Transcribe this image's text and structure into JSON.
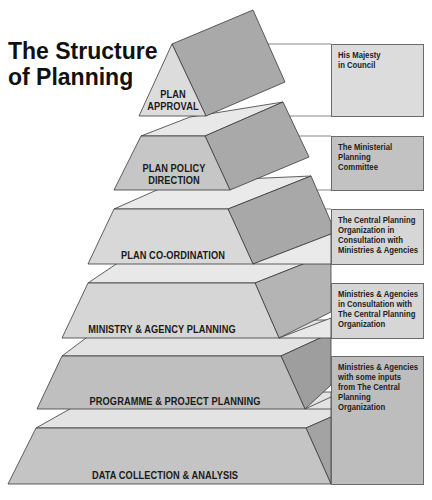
{
  "title": {
    "line1": "The Structure",
    "line2": "of Planning"
  },
  "colors": {
    "top_face": "#e8e8e8",
    "front_light": "#d8d8d8",
    "front_medium": "#c2c2c2",
    "side_dark": "#a9a9a9",
    "side_darker": "#9c9c9c",
    "box_light": "#dcdcdc",
    "box_medium": "#c0c0c0",
    "outline": "#3a3a3a"
  },
  "tiers": [
    {
      "label_line1": "PLAN",
      "label_line2": "APPROVAL",
      "responsible": "His Majesty\nin Council"
    },
    {
      "label_line1": "PLAN POLICY",
      "label_line2": "DIRECTION",
      "responsible": "The Ministerial\nPlanning\nCommittee"
    },
    {
      "label_line1": "PLAN CO-ORDINATION",
      "responsible": "The Central Planning\nOrganization in\nConsultation with\nMinistries & Agencies"
    },
    {
      "label_line1": "MINISTRY & AGENCY PLANNING",
      "responsible": "Ministries & Agencies\nin Consultation with\nThe Central Planning\nOrganization"
    },
    {
      "label_line1": "PROGRAMME & PROJECT PLANNING",
      "responsible": "Ministries & Agencies\nwith some inputs\nfrom The Central\nPlanning\nOrganization"
    },
    {
      "label_line1": "DATA COLLECTION & ANALYSIS",
      "responsible": ""
    }
  ]
}
